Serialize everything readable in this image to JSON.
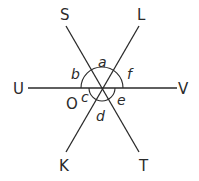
{
  "diagram": {
    "title": "",
    "center_label": "O",
    "points": {
      "S": "S",
      "L": "L",
      "U": "U",
      "V": "V",
      "K": "K",
      "T": "T"
    },
    "angles": {
      "a": "a",
      "b": "b",
      "c": "c",
      "d": "d",
      "e": "e",
      "f": "f"
    },
    "lines": [
      "SOT",
      "LOK",
      "UOV"
    ],
    "colors": {
      "stroke": "#2a2a2a",
      "background": "#ffffff"
    }
  }
}
